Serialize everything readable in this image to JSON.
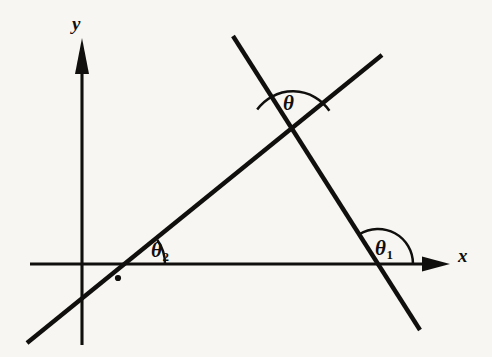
{
  "figure": {
    "kind": "geometry-diagram",
    "background_color": "#f7f6f2",
    "ink_color": "#100f0d",
    "width": 492,
    "height": 357
  },
  "axes": {
    "x": {
      "label": "x",
      "label_x": 458,
      "label_y": 246,
      "start_x": 30,
      "end_x": 450,
      "y": 264,
      "arrow": "right"
    },
    "y": {
      "label": "y",
      "label_x": 72,
      "label_y": 14,
      "x": 82,
      "start_y": 345,
      "end_y": 38,
      "arrow": "up"
    }
  },
  "lines": [
    {
      "name": "rising-line",
      "x1": 27,
      "y1": 343,
      "x2": 382,
      "y2": 55,
      "x_intercept_x": 124,
      "x_intercept_y": 264,
      "inclination_label": "theta-2"
    },
    {
      "name": "falling-line",
      "x1": 233,
      "y1": 36,
      "x2": 420,
      "y2": 330,
      "x_intercept_x": 378,
      "x_intercept_y": 264,
      "inclination_label": "theta-1"
    }
  ],
  "intersection": {
    "x": 292,
    "y": 135
  },
  "point_marker": {
    "x": 118,
    "y": 278,
    "radius": 3.1
  },
  "angles": [
    {
      "id": "theta",
      "symbol": "θ",
      "subscript": "",
      "vertex_x": 292,
      "vertex_y": 135,
      "radius": 44,
      "label_x": 283,
      "label_y": 93,
      "arc_path": "M 256.6 108.9 A 44 44 0 0 1 328.6 109.7",
      "note": "angle between the two lines, opening upward"
    },
    {
      "id": "theta-2",
      "symbol": "θ",
      "subscript": "2",
      "vertex_x": 124,
      "vertex_y": 264,
      "radius": 41,
      "label_x": 151,
      "label_y": 240,
      "arc_path": "M 165 264 A 41 41 0 0 0 157.3 239.9",
      "note": "inclination of the rising line with the positive x-axis"
    },
    {
      "id": "theta-1",
      "symbol": "θ",
      "subscript": "1",
      "vertex_x": 378,
      "vertex_y": 264,
      "radius": 35,
      "label_x": 375,
      "label_y": 238,
      "arc_path": "M 413 264 A 35 35 0 0 0 359.5 234.5",
      "note": "inclination of the falling line with the positive x-axis, obtuse"
    }
  ]
}
